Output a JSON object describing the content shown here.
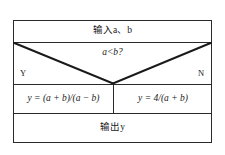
{
  "diagram": {
    "type": "flowchart",
    "frame": {
      "border_color": "#2a2a2a",
      "background_color": "#ffffff"
    },
    "rows": {
      "input_label": "输入a、b",
      "decision_label": "a<b?",
      "branch_yes_label": "Y",
      "branch_no_label": "N",
      "branch_yes_expression": "y = (a + b)/(a − b)",
      "branch_no_expression": "y = 4/(a + b)",
      "output_label": "输出y"
    }
  }
}
